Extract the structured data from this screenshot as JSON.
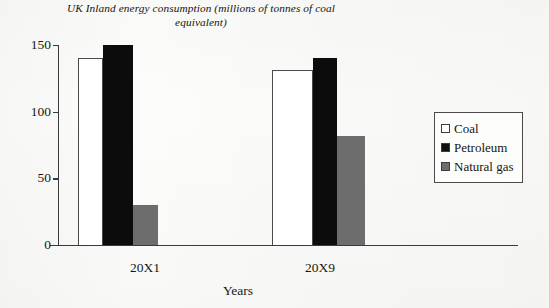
{
  "chart_data": {
    "type": "bar",
    "title": "UK Inland energy consumption (millions of tonnes of coal equivalent)",
    "title_line1": "UK Inland energy consumption (millions of",
    "title_line2": "tonnes of coal equivalent)",
    "xlabel": "Years",
    "ylabel": "",
    "categories": [
      "20X1",
      "20X9"
    ],
    "ylim": [
      0,
      150
    ],
    "yticks": [
      0,
      50,
      100,
      150
    ],
    "ytick_labels": [
      "0",
      "50",
      "100",
      "150"
    ],
    "grid": false,
    "legend_position": "right",
    "series": [
      {
        "name": "Coal",
        "values": [
          140,
          131
        ],
        "color": "#ffffff"
      },
      {
        "name": "Petroleum",
        "values": [
          150,
          140
        ],
        "color": "#0c0c0c"
      },
      {
        "name": "Natural gas",
        "values": [
          30,
          82
        ],
        "color": "#6d6d6d"
      }
    ]
  },
  "legend": {
    "items": [
      {
        "label": "Coal",
        "swatch": "coal"
      },
      {
        "label": "Petroleum",
        "swatch": "petroleum"
      },
      {
        "label": "Natural gas",
        "swatch": "gas"
      }
    ]
  },
  "colors": {
    "coal": "#ffffff",
    "petroleum": "#0c0c0c",
    "natural_gas": "#6d6d6d",
    "axis": "#3a3a3a",
    "background": "#fcfcfa"
  }
}
